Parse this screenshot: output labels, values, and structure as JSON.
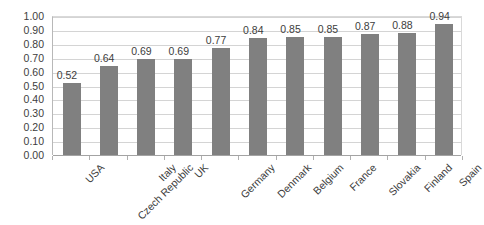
{
  "chart_data": {
    "type": "bar",
    "title": "",
    "subtitle": "",
    "xlabel": "",
    "ylabel": "",
    "ylim": [
      0.0,
      1.0
    ],
    "ytick_step": 0.1,
    "grid": true,
    "legend": false,
    "orientation": "vertical",
    "bar_color": "#808080",
    "gridline_color": "#d4d4d4",
    "axis_color": "#b8b8b8",
    "label_rotation_deg": -45,
    "categories": [
      "USA",
      "Czech Republic",
      "Italy",
      "UK",
      "Germany",
      "Denmark",
      "Belgium",
      "France",
      "Slovakia",
      "Finland",
      "Spain"
    ],
    "values": [
      0.52,
      0.64,
      0.69,
      0.69,
      0.77,
      0.84,
      0.85,
      0.85,
      0.87,
      0.88,
      0.94
    ],
    "value_labels": [
      "0.52",
      "0.64",
      "0.69",
      "0.69",
      "0.77",
      "0.84",
      "0.85",
      "0.85",
      "0.87",
      "0.88",
      "0.94"
    ],
    "ytick_labels": [
      "1.00",
      "0.90",
      "0.80",
      "0.70",
      "0.60",
      "0.50",
      "0.40",
      "0.30",
      "0.20",
      "0.10",
      "0.00"
    ],
    "ytick_values": [
      1.0,
      0.9,
      0.8,
      0.7,
      0.6,
      0.5,
      0.4,
      0.3,
      0.2,
      0.1,
      0.0
    ]
  }
}
